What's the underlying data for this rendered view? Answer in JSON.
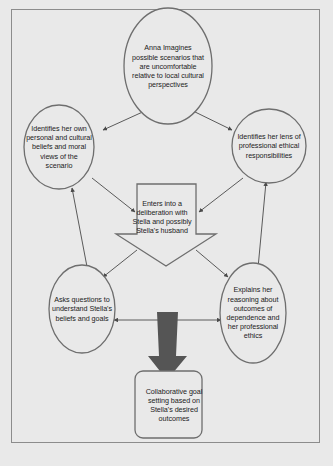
{
  "diagram": {
    "type": "flowchart",
    "title": "",
    "frame": {
      "border_color": "#8c8c8c",
      "background": "#e9e9e9"
    },
    "palette": {
      "shape_stroke": "#6e6e6e",
      "shape_fill": "#e9e9e9",
      "connector": "#4a4a4a",
      "highlight_arrow": "#555555",
      "text": "#1c1c1c"
    },
    "nodes": [
      {
        "id": "top",
        "shape": "ellipse",
        "label": "Anna Imagines possible scenarios that are uncomfortable relative to local cultural perspectives"
      },
      {
        "id": "left",
        "shape": "ellipse",
        "label": "Identifies her own personal and cultural beliefs and moral views of the scenario"
      },
      {
        "id": "right",
        "shape": "ellipse",
        "label": "Identifies her lens of professional ethical responsibilities"
      },
      {
        "id": "center",
        "shape": "down-block-arrow",
        "label": "Enters into a deliberation with Stella and possibly Stella's husband"
      },
      {
        "id": "bottom-left",
        "shape": "ellipse",
        "label": "Asks questions to understand Stella's beliefs and goals"
      },
      {
        "id": "bottom-right",
        "shape": "ellipse",
        "label": "Explains her reasoning about outcomes of dependence and her professional ethics"
      },
      {
        "id": "bottom",
        "shape": "rounded-rectangle",
        "label": "Collaborative goal setting based on Stella's desired outcomes"
      }
    ],
    "edges": [
      {
        "from": "top",
        "to": "left",
        "style": "single-arrow"
      },
      {
        "from": "top",
        "to": "right",
        "style": "single-arrow"
      },
      {
        "from": "left",
        "to": "center",
        "style": "single-arrow"
      },
      {
        "from": "right",
        "to": "center",
        "style": "single-arrow"
      },
      {
        "from": "center",
        "to": "bottom-left",
        "style": "single-arrow"
      },
      {
        "from": "center",
        "to": "bottom-right",
        "style": "single-arrow"
      },
      {
        "from": "bottom-left",
        "to": "left",
        "style": "single-arrow"
      },
      {
        "from": "bottom-right",
        "to": "right",
        "style": "single-arrow"
      },
      {
        "from": "bottom-left",
        "to": "bottom-right",
        "style": "double-arrow"
      },
      {
        "from": "deliberation-block",
        "to": "bottom",
        "style": "thick-block-arrow"
      }
    ]
  }
}
